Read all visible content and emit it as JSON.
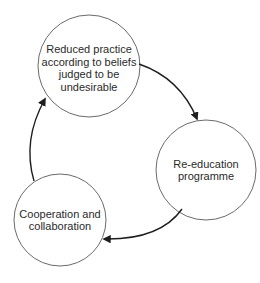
{
  "diagram": {
    "type": "cycle",
    "colors": {
      "stroke": "#6a6a6a",
      "arrow": "#1e1e1e",
      "text": "#2a2a2a",
      "background": "#ffffff"
    },
    "nodes": [
      {
        "id": "reduced-practice",
        "label": "Reduced practice\naccording to beliefs\njudged to be\nundesirable",
        "cx": 89,
        "cy": 66,
        "r": 51
      },
      {
        "id": "re-education",
        "label": "Re-education\nprogramme",
        "cx": 206,
        "cy": 170,
        "r": 50
      },
      {
        "id": "cooperation",
        "label": "Cooperation and\ncollaboration",
        "cx": 60,
        "cy": 220,
        "r": 46
      }
    ],
    "edges": [
      {
        "from": "reduced-practice",
        "to": "re-education"
      },
      {
        "from": "re-education",
        "to": "cooperation"
      },
      {
        "from": "cooperation",
        "to": "reduced-practice"
      }
    ]
  }
}
